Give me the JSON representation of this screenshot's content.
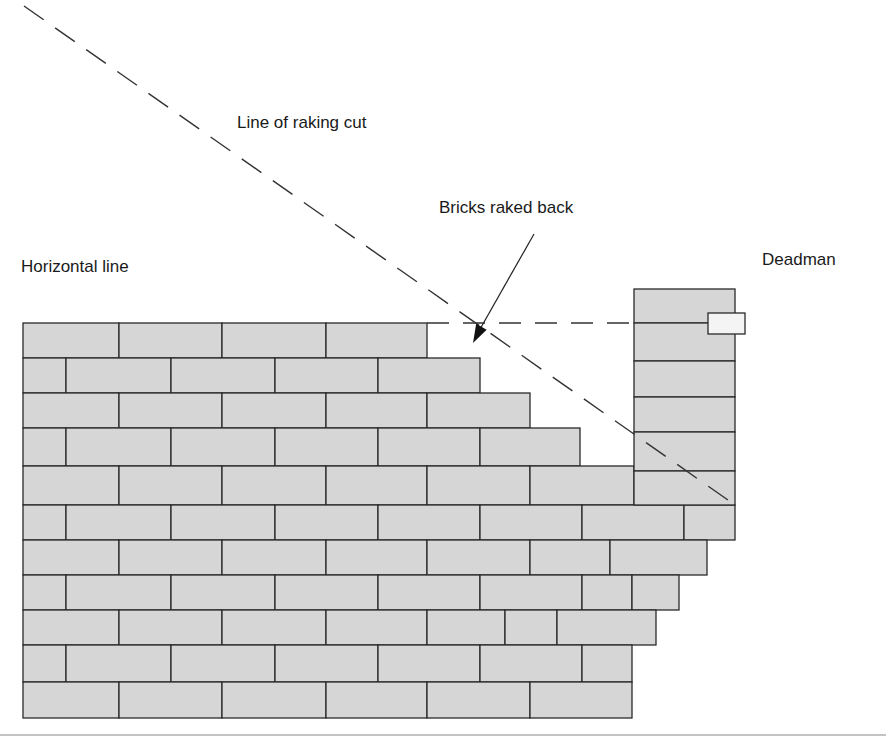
{
  "labels": {
    "raking_cut": "Line of raking cut",
    "bricks_raked_back": "Bricks raked back",
    "horizontal_line": "Horizontal line",
    "deadman": "Deadman"
  },
  "colors": {
    "brick_fill": "#d6d6d6",
    "mortar_line": "#2a2a2a",
    "dash_line": "#333333",
    "tag_fill": "#f4f4f4"
  },
  "wall": {
    "courses": [
      {
        "y": 323,
        "h": 35,
        "joints": [
          23,
          119,
          222,
          326,
          427
        ]
      },
      {
        "y": 358,
        "h": 35,
        "joints": [
          23,
          66,
          171,
          275,
          378,
          480
        ]
      },
      {
        "y": 393,
        "h": 35,
        "joints": [
          23,
          119,
          222,
          326,
          427,
          530
        ]
      },
      {
        "y": 428,
        "h": 38,
        "joints": [
          23,
          66,
          171,
          275,
          378,
          480,
          580
        ]
      },
      {
        "y": 466,
        "h": 39,
        "joints": [
          23,
          119,
          222,
          326,
          427,
          530,
          634
        ]
      },
      {
        "y": 505,
        "h": 35,
        "joints": [
          23,
          66,
          171,
          275,
          378,
          480,
          582,
          684,
          735
        ]
      },
      {
        "y": 540,
        "h": 35,
        "joints": [
          23,
          119,
          222,
          326,
          427,
          530,
          610,
          707
        ]
      },
      {
        "y": 575,
        "h": 35,
        "joints": [
          23,
          66,
          171,
          275,
          378,
          480,
          582,
          632,
          679
        ]
      },
      {
        "y": 610,
        "h": 35,
        "joints": [
          23,
          119,
          222,
          326,
          427,
          505,
          557,
          656
        ]
      },
      {
        "y": 645,
        "h": 37,
        "joints": [
          23,
          66,
          171,
          275,
          378,
          480,
          582,
          632
        ]
      },
      {
        "y": 682,
        "h": 36,
        "joints": [
          23,
          119,
          222,
          326,
          427,
          530,
          632
        ]
      }
    ]
  },
  "deadman_column": {
    "x": 634,
    "width": 101,
    "top": 289,
    "bottom": 505,
    "courses": [
      289,
      323,
      361,
      397,
      432,
      471,
      505
    ],
    "tag": {
      "x": 708,
      "y": 313,
      "width": 37,
      "height": 21
    }
  },
  "lines": {
    "raking_cut": {
      "x1": 24,
      "y1": 6,
      "x2": 735,
      "y2": 505
    },
    "horizontal": {
      "x1": 427,
      "y1": 323,
      "x2": 634,
      "y2": 323
    },
    "pointer": {
      "x1": 534,
      "y1": 234,
      "x2": 475,
      "y2": 338
    },
    "baseline_y": 735
  }
}
